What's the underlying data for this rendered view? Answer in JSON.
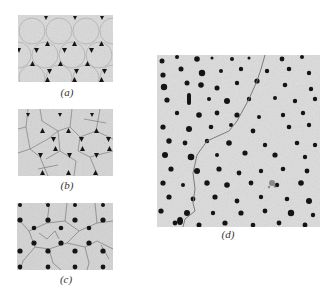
{
  "figure": {
    "panels": [
      {
        "id": "a",
        "label": "(a)",
        "label_text": "a",
        "description": "Close-packed circular grains with dark triangular second-phase particles at triple junctions"
      },
      {
        "id": "b",
        "label": "(b)",
        "label_text": "b",
        "description": "Grains with additional grain boundaries crossing, dark triangular particles at junctions"
      },
      {
        "id": "c",
        "label": "(c)",
        "label_text": "c",
        "description": "Polygonal grain network with rounded dark particles at junctions"
      },
      {
        "id": "d",
        "label": "(d)",
        "label_text": "d",
        "description": "Large field of regularly arrayed dark dots of varying size with a single meandering grain boundary"
      }
    ]
  },
  "colors": {
    "background": "#ffffff",
    "micrograph_bg": "#d9d9d9",
    "particle": "#151515",
    "boundary": "#6e6e6e"
  }
}
